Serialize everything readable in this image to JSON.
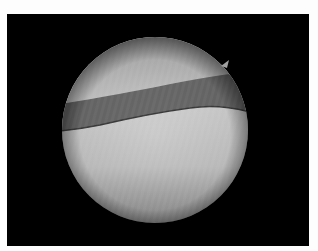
{
  "image": {
    "description": "Arthroscopic circular field-of-view on black background showing a dark diagonal band across lighter tissue",
    "background_color": "#000000",
    "border_color": "#fdfdfd",
    "field_of_view": {
      "shape": "circle",
      "cx": 155,
      "cy": 130,
      "r": 93
    },
    "colors": {
      "upper_tissue": "#b4b4b4",
      "band": "#676767",
      "band_edge": "#3a3a3a",
      "lower_tissue": "#c4c4c4",
      "vignette": "#4a4a4a"
    }
  }
}
